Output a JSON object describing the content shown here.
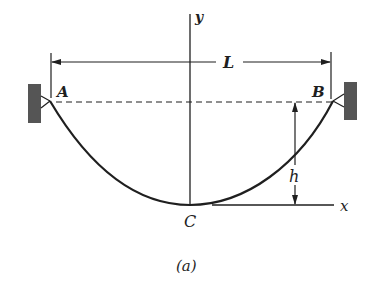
{
  "figure": {
    "caption": "(a)"
  },
  "labels": {
    "point_a": "A",
    "point_b": "B",
    "point_c": "C",
    "span": "L",
    "sag": "h",
    "x_axis": "x",
    "y_axis": "y"
  },
  "colors": {
    "line": "#1f1f1f",
    "wall": "#555555",
    "background": "#ffffff"
  }
}
